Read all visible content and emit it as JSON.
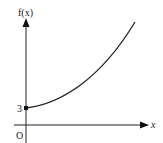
{
  "diagram": {
    "type": "function-graph",
    "labels": {
      "y_axis": "f(x)",
      "x_axis": "x",
      "origin": "O",
      "y_intercept": "3"
    },
    "curve": {
      "description": "increasing convex curve starting at (0, 3)",
      "start_point": {
        "x": 0,
        "y": 3
      }
    },
    "colors": {
      "axis": "#222222",
      "curve": "#222222",
      "background": "#ffffff"
    }
  }
}
